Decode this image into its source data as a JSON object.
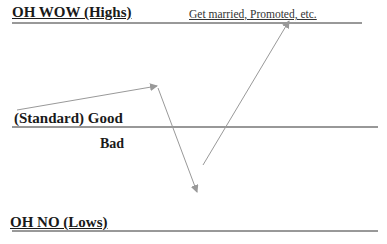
{
  "diagram": {
    "top_label": "OH WOW (Highs)",
    "top_note": "Get married, Promoted, etc.",
    "middle_label": "(Standard)  Good",
    "middle_sub_label": "Bad",
    "bottom_label": "OH NO  (Lows)",
    "colors": {
      "line": "#333333",
      "arrow": "#999999",
      "text": "#1a1a1a"
    },
    "path_points": [
      {
        "x": 17,
        "y": 110
      },
      {
        "x": 157,
        "y": 86
      },
      {
        "x": 197,
        "y": 192
      },
      {
        "x": 203,
        "y": 165
      },
      {
        "x": 289,
        "y": 21
      }
    ]
  }
}
